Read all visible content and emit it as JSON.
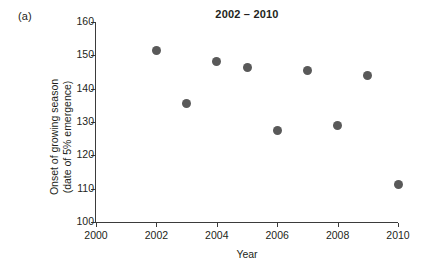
{
  "figure": {
    "panel_label": "(a)",
    "title": "2002 – 2010"
  },
  "chart_data": {
    "type": "scatter",
    "title": "2002 – 2010",
    "xlabel": "Year",
    "ylabel": "Onset of growing season (date of 5% emergence)",
    "ylabel_line1": "Onset of growing season",
    "ylabel_line2": "(date of 5% emergence)",
    "xlim": [
      2000,
      2010
    ],
    "ylim": [
      100,
      160
    ],
    "xticks": [
      2000,
      2002,
      2004,
      2006,
      2008,
      2010
    ],
    "yticks": [
      100,
      110,
      120,
      130,
      140,
      150,
      160
    ],
    "grid": false,
    "legend": false,
    "marker_color": "#595959",
    "axis_color": "#3b3b3b",
    "x": [
      2002,
      2003,
      2004,
      2005,
      2006,
      2007,
      2008,
      2009,
      2010
    ],
    "y": [
      151.5,
      135.7,
      148.3,
      146.5,
      127.5,
      145.5,
      129.0,
      144.0,
      111.3
    ],
    "points": [
      {
        "x": 2002,
        "y": 151.5
      },
      {
        "x": 2003,
        "y": 135.7
      },
      {
        "x": 2004,
        "y": 148.3
      },
      {
        "x": 2005,
        "y": 146.5
      },
      {
        "x": 2006,
        "y": 127.5
      },
      {
        "x": 2007,
        "y": 145.5
      },
      {
        "x": 2008,
        "y": 129.0
      },
      {
        "x": 2009,
        "y": 144.0
      },
      {
        "x": 2010,
        "y": 111.3
      }
    ]
  }
}
